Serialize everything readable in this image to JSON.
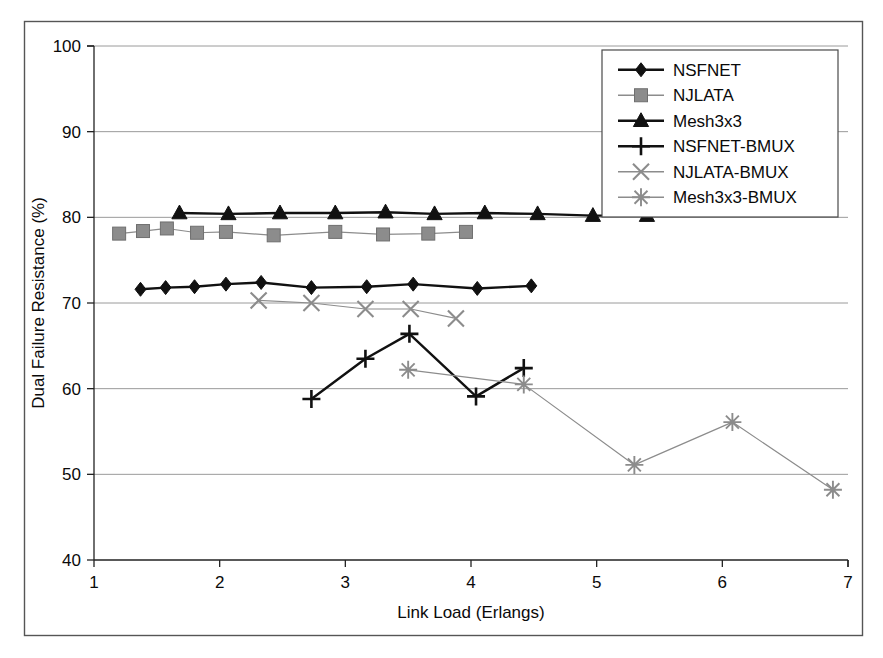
{
  "chart_data": {
    "type": "line",
    "title": "",
    "xlabel": "Link Load (Erlangs)",
    "ylabel": "Dual Failure Resistance (%)",
    "xlim": [
      1,
      7
    ],
    "ylim": [
      40,
      100
    ],
    "xticks": [
      1,
      2,
      3,
      4,
      5,
      6,
      7
    ],
    "yticks": [
      40,
      50,
      60,
      70,
      80,
      90,
      100
    ],
    "xtick_labels": [
      "1",
      "2",
      "3",
      "4",
      "5",
      "6",
      "7"
    ],
    "ytick_labels": [
      "40",
      "50",
      "60",
      "70",
      "80",
      "90",
      "100"
    ],
    "grid": "horizontal",
    "legend_position": "top-right",
    "series": [
      {
        "name": "NSFNET",
        "marker": "diamond",
        "color": "#111111",
        "points": [
          {
            "x": 1.37,
            "y": 71.6
          },
          {
            "x": 1.57,
            "y": 71.8
          },
          {
            "x": 1.8,
            "y": 71.9
          },
          {
            "x": 2.05,
            "y": 72.2
          },
          {
            "x": 2.33,
            "y": 72.4
          },
          {
            "x": 2.73,
            "y": 71.8
          },
          {
            "x": 3.17,
            "y": 71.9
          },
          {
            "x": 3.54,
            "y": 72.2
          },
          {
            "x": 4.05,
            "y": 71.7
          },
          {
            "x": 4.48,
            "y": 72.0
          }
        ]
      },
      {
        "name": "NJLATA",
        "marker": "square",
        "color": "#8c8c8c",
        "points": [
          {
            "x": 1.2,
            "y": 78.1
          },
          {
            "x": 1.39,
            "y": 78.4
          },
          {
            "x": 1.58,
            "y": 78.7
          },
          {
            "x": 1.82,
            "y": 78.2
          },
          {
            "x": 2.05,
            "y": 78.3
          },
          {
            "x": 2.43,
            "y": 77.9
          },
          {
            "x": 2.92,
            "y": 78.3
          },
          {
            "x": 3.3,
            "y": 78.0
          },
          {
            "x": 3.66,
            "y": 78.1
          },
          {
            "x": 3.96,
            "y": 78.3
          }
        ]
      },
      {
        "name": "Mesh3x3",
        "marker": "triangle",
        "color": "#111111",
        "points": [
          {
            "x": 1.68,
            "y": 80.5
          },
          {
            "x": 2.07,
            "y": 80.4
          },
          {
            "x": 2.48,
            "y": 80.5
          },
          {
            "x": 2.92,
            "y": 80.5
          },
          {
            "x": 3.32,
            "y": 80.6
          },
          {
            "x": 3.71,
            "y": 80.4
          },
          {
            "x": 4.11,
            "y": 80.5
          },
          {
            "x": 4.53,
            "y": 80.4
          },
          {
            "x": 4.97,
            "y": 80.2
          },
          {
            "x": 5.4,
            "y": 80.2
          }
        ]
      },
      {
        "name": "NSFNET-BMUX",
        "marker": "plus",
        "color": "#111111",
        "points": [
          {
            "x": 2.73,
            "y": 58.8
          },
          {
            "x": 3.16,
            "y": 63.5
          },
          {
            "x": 3.51,
            "y": 66.4
          },
          {
            "x": 4.04,
            "y": 59.1
          },
          {
            "x": 4.42,
            "y": 62.4
          }
        ]
      },
      {
        "name": "NJLATA-BMUX",
        "marker": "cross",
        "color": "#8c8c8c",
        "points": [
          {
            "x": 2.31,
            "y": 70.3
          },
          {
            "x": 2.73,
            "y": 70.0
          },
          {
            "x": 3.16,
            "y": 69.3
          },
          {
            "x": 3.52,
            "y": 69.3
          },
          {
            "x": 3.88,
            "y": 68.2
          }
        ]
      },
      {
        "name": "Mesh3x3-BMUX",
        "marker": "star",
        "color": "#8c8c8c",
        "points": [
          {
            "x": 3.5,
            "y": 62.2
          },
          {
            "x": 4.42,
            "y": 60.5
          },
          {
            "x": 5.3,
            "y": 51.1
          },
          {
            "x": 6.08,
            "y": 56.1
          },
          {
            "x": 6.88,
            "y": 48.2
          }
        ]
      }
    ]
  },
  "legend": {
    "entries": [
      {
        "label": "NSFNET"
      },
      {
        "label": "NJLATA"
      },
      {
        "label": "Mesh3x3"
      },
      {
        "label": "NSFNET-BMUX"
      },
      {
        "label": "NJLATA-BMUX"
      },
      {
        "label": "Mesh3x3-BMUX"
      }
    ]
  },
  "colors": {
    "dark": "#111111",
    "gray": "#8c8c8c",
    "grid": "#9a9a9a",
    "axis": "#222222",
    "border": "#555555",
    "background": "#ffffff"
  }
}
